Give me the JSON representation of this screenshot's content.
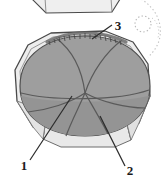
{
  "figure": {
    "background_color": "#ffffff",
    "colors": {
      "dome_fill": "#9e9e9e",
      "dome_fill_lower": "#949494",
      "shell_fill": "#ededed",
      "shell_fill_shadow": "#e2e2e2",
      "facet_fill": "#e9e9e9",
      "outline": "#4a4a4a",
      "segment_line": "#5a5a5a",
      "rim_texture": "#6b6b6b",
      "leader_line": "#2b2b2b",
      "dotted_guide": "#b8b8b8",
      "label_text": "#1a1a1a"
    },
    "partial_object_top": {
      "name": "cropped-upper-specimen",
      "description": "bottom edge of a second specimen cropped by the top frame border"
    },
    "dotted_guides": {
      "circle": {
        "name": "dotted-circle-guide",
        "cx": 143,
        "cy": 24,
        "r": 8
      },
      "arc": {
        "name": "dotted-arc-guide",
        "description": "faint dotted arc sweeping down the right margin"
      }
    },
    "callouts": [
      {
        "id": "callout-1",
        "label": "1",
        "label_x": 24,
        "label_y": 166,
        "target_x": 72,
        "target_y": 96,
        "description": "leader line to lower-left dome segment boundary"
      },
      {
        "id": "callout-2",
        "label": "2",
        "label_x": 129,
        "label_y": 172,
        "target_x": 100,
        "target_y": 116,
        "description": "leader line to lower-right dome segment boundary"
      },
      {
        "id": "callout-3",
        "label": "3",
        "label_x": 118,
        "label_y": 27,
        "target_x": 93,
        "target_y": 38,
        "description": "leader line to textured rim at the top of the dome"
      }
    ],
    "segments": {
      "count": 6,
      "center_x": 85,
      "center_y": 93,
      "description": "six segment lines radiating from a single convergence point on the dome"
    }
  }
}
